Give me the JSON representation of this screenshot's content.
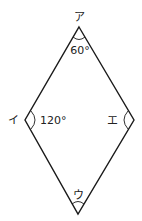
{
  "diagram": {
    "shape": "rhombus",
    "vertices": [
      {
        "id": "top",
        "label": "ア",
        "x": 79,
        "y": 27
      },
      {
        "id": "left",
        "label": "イ",
        "x": 25,
        "y": 120
      },
      {
        "id": "bottom",
        "label": "ウ",
        "x": 78,
        "y": 214
      },
      {
        "id": "right",
        "label": "エ",
        "x": 134,
        "y": 120
      }
    ],
    "angles": {
      "top": "60°",
      "left": "120°"
    },
    "colors": {
      "stroke": "#1a1a1a",
      "text": "#222222"
    }
  }
}
